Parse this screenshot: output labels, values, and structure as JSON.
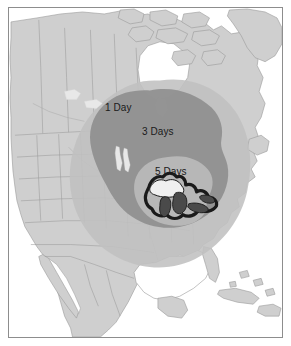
{
  "figure": {
    "name": "north-america-transit-time-map",
    "frame_color": "#8d8d8d",
    "background_color": "#ffffff"
  },
  "map": {
    "land_color": "#cfcfcf",
    "land_border_color": "#9a9a9a",
    "ocean_color": "#ffffff",
    "inland_water_color": "#f2f2f2",
    "great_lakes_fill": "#4a4a4a",
    "great_lakes_outline": "#1a1a1a"
  },
  "zones": [
    {
      "id": "zone-5-days",
      "label": "5 Days",
      "days": 5,
      "color": "#c0c0c0",
      "rank": 3
    },
    {
      "id": "zone-3-days",
      "label": "3 Days",
      "days": 3,
      "color": "#8f8f8f",
      "rank": 2
    },
    {
      "id": "zone-1-day",
      "label": "1 Day",
      "days": 1,
      "color": "#b8b8b8",
      "rank": 1
    }
  ]
}
